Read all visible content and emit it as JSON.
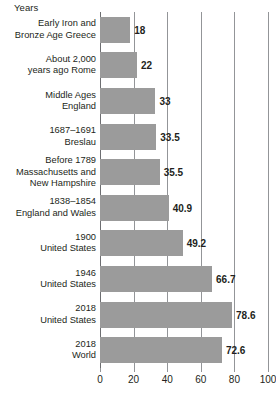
{
  "chart_data": {
    "type": "bar",
    "orientation": "horizontal",
    "title": "Years",
    "xlabel": "",
    "ylabel": "",
    "xlim": [
      0,
      100
    ],
    "xticks": [
      0,
      20,
      40,
      60,
      80,
      100
    ],
    "xtick_labels": [
      "0",
      "20",
      "40",
      "60",
      "80",
      "100"
    ],
    "grid": true,
    "grid_axis": "x",
    "legend": "none",
    "bar_color": "#9b9b9b",
    "axis_color": "#939598",
    "text_color": "#231f20",
    "categories": [
      "Early Iron and Bronze Age Greece",
      "About 2,000 years ago Rome",
      "Middle Ages England",
      "1687–1691 Breslau",
      "Before 1789 Massachusetts and New Hampshire",
      "1838–1854 England and Wales",
      "1900 United States",
      "1946 United States",
      "2018 United States",
      "2018 World"
    ],
    "category_lines": [
      [
        "Early Iron and",
        "Bronze Age Greece"
      ],
      [
        "About 2,000",
        "years ago Rome"
      ],
      [
        "Middle Ages",
        "England"
      ],
      [
        "1687–1691",
        "Breslau"
      ],
      [
        "Before 1789",
        "Massachusetts and",
        "New Hampshire"
      ],
      [
        "1838–1854",
        "England and Wales"
      ],
      [
        "1900",
        "United States"
      ],
      [
        "1946",
        "United States"
      ],
      [
        "2018",
        "United States"
      ],
      [
        "2018",
        "World"
      ]
    ],
    "values": [
      18,
      22,
      33,
      33.5,
      35.5,
      40.9,
      49.2,
      66.7,
      78.6,
      72.6
    ],
    "value_labels": [
      "18",
      "22",
      "33",
      "33.5",
      "35.5",
      "40.9",
      "49.2",
      "66.7",
      "78.6",
      "72.6"
    ]
  }
}
